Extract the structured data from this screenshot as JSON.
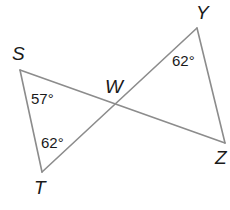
{
  "figure": {
    "type": "geometry",
    "line_color": "#8c8c8c",
    "text_color": "#1a1a1a",
    "vertices": {
      "S": {
        "label": "S",
        "x": 20,
        "y": 70
      },
      "T": {
        "label": "T",
        "x": 42,
        "y": 172
      },
      "W": {
        "label": "W",
        "x": 117,
        "y": 103
      },
      "Y": {
        "label": "Y",
        "x": 197,
        "y": 28
      },
      "Z": {
        "label": "Z",
        "x": 225,
        "y": 143
      }
    },
    "segments": [
      {
        "from": "S",
        "to": "Z"
      },
      {
        "from": "T",
        "to": "Y"
      },
      {
        "from": "S",
        "to": "T"
      },
      {
        "from": "Y",
        "to": "Z"
      }
    ],
    "angles": [
      {
        "vertex": "S",
        "label": "57°"
      },
      {
        "vertex": "T",
        "label": "62°"
      },
      {
        "vertex": "Y",
        "label": "62°"
      }
    ]
  }
}
